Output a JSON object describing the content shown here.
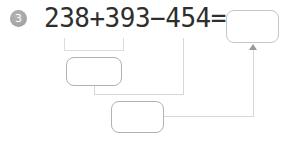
{
  "problem": {
    "number": "3",
    "expression": "238+393−454=",
    "operands": [
      "238",
      "393",
      "454"
    ],
    "operators": [
      "+",
      "−",
      "="
    ]
  },
  "diagram": {
    "bracket_groups": "238+393",
    "boxes": [
      {
        "id": "step1-box",
        "value": "",
        "fed_by": "bracket under 238+393"
      },
      {
        "id": "step2-box",
        "value": "",
        "fed_by": "step1-box and line from 454"
      },
      {
        "id": "answer-box",
        "value": "",
        "fed_by": "arrow up from step2-box"
      }
    ]
  },
  "colors": {
    "text": "#2e2e2e",
    "badge_bg": "#a3a3a3",
    "badge_text": "#ffffff",
    "box_border": "#aeb4b4",
    "connector_line": "#d5d8d8",
    "bracket_line": "#dcdcdc",
    "arrow": "#959b9b",
    "background": "#ffffff"
  }
}
